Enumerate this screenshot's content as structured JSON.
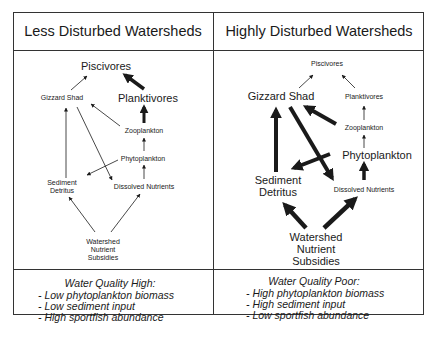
{
  "panels": [
    {
      "title": "Less Disturbed Watersheds",
      "nodes": {
        "piscivores": "Piscivores",
        "gizzard_shad": "Gizzard Shad",
        "planktivores": "Planktivores",
        "zooplankton": "Zooplankton",
        "phytoplankton": "Phytoplankton",
        "sediment_1": "Sediment",
        "sediment_2": "Detritus",
        "dissolved": "Dissolved Nutrients",
        "watershed_1": "Watershed",
        "watershed_2": "Nutrient",
        "watershed_3": "Subsidies"
      },
      "summary": {
        "heading": "Water Quality High:",
        "items": [
          "- Low phytoplankton biomass",
          "- Low sediment input",
          "- High sportfish abundance"
        ]
      }
    },
    {
      "title": "Highly Disturbed Watersheds",
      "nodes": {
        "piscivores": "Piscivores",
        "gizzard_shad": "Gizzard Shad",
        "planktivores": "Planktivores",
        "zooplankton": "Zooplankton",
        "phytoplankton": "Phytoplankton",
        "sediment_1": "Sediment",
        "sediment_2": "Detritus",
        "dissolved": "Dissolved Nutrients",
        "watershed_1": "Watershed",
        "watershed_2": "Nutrient",
        "watershed_3": "Subsidies"
      },
      "summary": {
        "heading": "Water Quality Poor:",
        "items": [
          "- High phytoplankton biomass",
          "- High sediment input",
          "- Low sportfish abundance"
        ]
      }
    }
  ],
  "colors": {
    "ink": "#1a1a1a",
    "border": "#333333",
    "background": "#ffffff"
  }
}
